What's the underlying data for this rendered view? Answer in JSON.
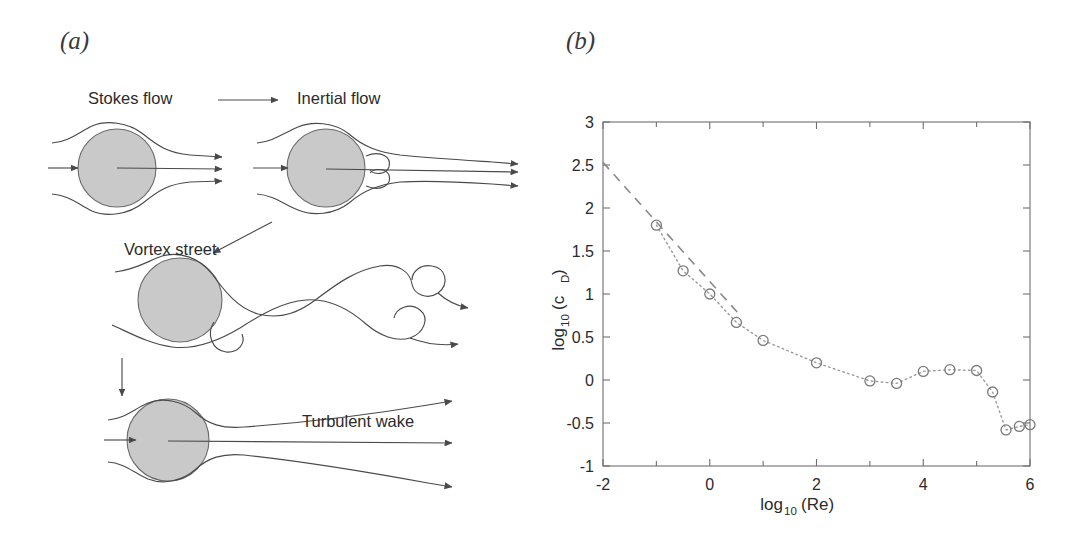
{
  "figure": {
    "panel_a_label": "(a)",
    "panel_b_label": "(b)"
  },
  "panel_a": {
    "title_role": "flow-regimes-diagram",
    "labels": {
      "stokes": "Stokes flow",
      "inertial": "Inertial flow",
      "vortex": "Vortex street",
      "turbulent": "Turbulent wake"
    },
    "arrows": [
      {
        "name": "stokes-to-inertial",
        "direction": "right"
      },
      {
        "name": "inertial-to-vortex",
        "direction": "down-left"
      },
      {
        "name": "vortex-to-turbulent",
        "direction": "down"
      }
    ]
  },
  "chart_data": {
    "type": "scatter",
    "title": "",
    "xlabel": "log10(Re)",
    "xlabel_base": "log",
    "xlabel_sub": "10",
    "xlabel_tail": "(Re)",
    "ylabel": "log10(c_D)",
    "ylabel_base": "log",
    "ylabel_sub": "10",
    "ylabel_tail": "(c",
    "ylabel_tail_sub": "D",
    "ylabel_tail_end": ")",
    "xlim": [
      -2,
      6
    ],
    "ylim": [
      -1,
      3
    ],
    "xticks": [
      -2,
      0,
      2,
      4,
      6
    ],
    "xticklabels": [
      "-2",
      "0",
      "2",
      "4",
      "6"
    ],
    "xminorticks": [
      -1,
      1,
      3,
      5
    ],
    "yticks": [
      -1,
      -0.5,
      0,
      0.5,
      1,
      1.5,
      2,
      2.5,
      3
    ],
    "yticklabels": [
      "-1",
      "-0.5",
      "0",
      "0.5",
      "1",
      "1.5",
      "2",
      "2.5",
      "3"
    ],
    "grid": false,
    "legend": false,
    "series": [
      {
        "name": "measured-drag-coefficient",
        "marker": "open-circle",
        "linestyle": "dotted",
        "x": [
          -1.0,
          -0.5,
          0.0,
          0.5,
          1.0,
          2.0,
          3.0,
          3.5,
          4.0,
          4.5,
          5.0,
          5.3,
          5.55,
          5.8,
          6.0
        ],
        "y": [
          1.8,
          1.27,
          1.0,
          0.67,
          0.46,
          0.2,
          -0.01,
          -0.04,
          0.1,
          0.12,
          0.11,
          -0.14,
          -0.58,
          -0.54,
          -0.52
        ]
      },
      {
        "name": "stokes-law-fit",
        "marker": "none",
        "linestyle": "dashed",
        "x": [
          -2.0,
          0.6
        ],
        "y": [
          2.53,
          0.73
        ]
      }
    ]
  }
}
